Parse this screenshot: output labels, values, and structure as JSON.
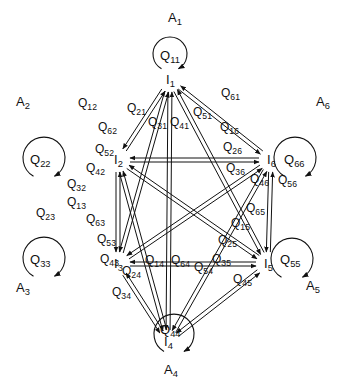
{
  "diagram": {
    "nodes": [
      {
        "id": "I1",
        "label": "I",
        "sub": "1",
        "x": 170,
        "y": 80,
        "area": "A",
        "area_sub": "1",
        "ax": 168,
        "ay": 22,
        "self": "Q",
        "self_sub": "11",
        "loop": {
          "cx": 170,
          "cy": 54,
          "r": 17
        },
        "sx": 160,
        "sy": 60
      },
      {
        "id": "I2",
        "label": "I",
        "sub": "2",
        "x": 118,
        "y": 160,
        "area": "A",
        "area_sub": "2",
        "ax": 16,
        "ay": 106,
        "self": "Q",
        "self_sub": "22",
        "loop": {
          "cx": 44,
          "cy": 158,
          "r": 21
        },
        "sx": 30,
        "sy": 164
      },
      {
        "id": "I3",
        "label": "I",
        "sub": "3",
        "x": 118,
        "y": 264,
        "area": "A",
        "area_sub": "3",
        "ax": 16,
        "ay": 292,
        "self": "Q",
        "self_sub": "33",
        "loop": {
          "cx": 44,
          "cy": 258,
          "r": 21
        },
        "sx": 30,
        "sy": 264
      },
      {
        "id": "I4",
        "label": "I",
        "sub": "4",
        "x": 168,
        "y": 342,
        "area": "A",
        "area_sub": "4",
        "ax": 164,
        "ay": 374,
        "self": "Q",
        "self_sub": "44",
        "loop": {
          "cx": 174,
          "cy": 334,
          "r": 20
        },
        "sx": 160,
        "sy": 334
      },
      {
        "id": "I5",
        "label": "I",
        "sub": "5",
        "x": 268,
        "y": 264,
        "area": "A",
        "area_sub": "5",
        "ax": 306,
        "ay": 290,
        "self": "Q",
        "self_sub": "55",
        "loop": {
          "cx": 292,
          "cy": 259,
          "r": 21
        },
        "sx": 280,
        "sy": 264
      },
      {
        "id": "I6",
        "label": "I",
        "sub": "6",
        "x": 271,
        "y": 160,
        "area": "A",
        "area_sub": "6",
        "ax": 316,
        "ay": 106,
        "self": "Q",
        "self_sub": "66",
        "loop": {
          "cx": 295,
          "cy": 158,
          "r": 21
        },
        "sx": 284,
        "sy": 164
      }
    ],
    "edges": [
      {
        "label": "Q",
        "sub": "12",
        "lx": 78,
        "ly": 107
      },
      {
        "label": "Q",
        "sub": "21",
        "lx": 127,
        "ly": 112
      },
      {
        "label": "Q",
        "sub": "62",
        "lx": 98,
        "ly": 131
      },
      {
        "label": "Q",
        "sub": "31",
        "lx": 148,
        "ly": 126
      },
      {
        "label": "Q",
        "sub": "41",
        "lx": 170,
        "ly": 126
      },
      {
        "label": "Q",
        "sub": "51",
        "lx": 193,
        "ly": 116
      },
      {
        "label": "Q",
        "sub": "61",
        "lx": 221,
        "ly": 97
      },
      {
        "label": "Q",
        "sub": "16",
        "lx": 220,
        "ly": 131
      },
      {
        "label": "Q",
        "sub": "52",
        "lx": 95,
        "ly": 153
      },
      {
        "label": "Q",
        "sub": "42",
        "lx": 86,
        "ly": 172
      },
      {
        "label": "Q",
        "sub": "26",
        "lx": 223,
        "ly": 151
      },
      {
        "label": "Q",
        "sub": "32",
        "lx": 67,
        "ly": 188
      },
      {
        "label": "Q",
        "sub": "36",
        "lx": 226,
        "ly": 172
      },
      {
        "label": "Q",
        "sub": "46",
        "lx": 250,
        "ly": 183
      },
      {
        "label": "Q",
        "sub": "56",
        "lx": 278,
        "ly": 184
      },
      {
        "label": "Q",
        "sub": "23",
        "lx": 36,
        "ly": 217
      },
      {
        "label": "Q",
        "sub": "13",
        "lx": 67,
        "ly": 206
      },
      {
        "label": "Q",
        "sub": "63",
        "lx": 86,
        "ly": 223
      },
      {
        "label": "Q",
        "sub": "65",
        "lx": 246,
        "ly": 212
      },
      {
        "label": "Q",
        "sub": "15",
        "lx": 231,
        "ly": 227
      },
      {
        "label": "Q",
        "sub": "53",
        "lx": 97,
        "ly": 243
      },
      {
        "label": "Q",
        "sub": "25",
        "lx": 218,
        "ly": 244
      },
      {
        "label": "Q",
        "sub": "43",
        "lx": 100,
        "ly": 263
      },
      {
        "label": "Q",
        "sub": "24",
        "lx": 122,
        "ly": 275
      },
      {
        "label": "Q",
        "sub": "14",
        "lx": 145,
        "ly": 264
      },
      {
        "label": "Q",
        "sub": "64",
        "lx": 171,
        "ly": 264
      },
      {
        "label": "Q",
        "sub": "54",
        "lx": 194,
        "ly": 271
      },
      {
        "label": "Q",
        "sub": "35",
        "lx": 212,
        "ly": 263
      },
      {
        "label": "Q",
        "sub": "45",
        "lx": 233,
        "ly": 283
      },
      {
        "label": "Q",
        "sub": "34",
        "lx": 112,
        "ly": 296
      }
    ]
  }
}
